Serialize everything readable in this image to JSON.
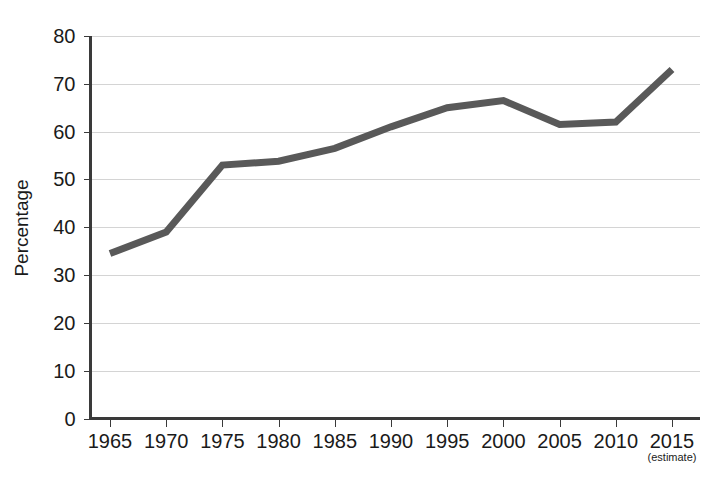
{
  "chart_data": {
    "type": "line",
    "title": "",
    "subtitle": "",
    "xlabel": "",
    "ylabel": "Percentage",
    "categories": [
      "1965",
      "1970",
      "1975",
      "1980",
      "1985",
      "1990",
      "1995",
      "2000",
      "2005",
      "2010",
      "2015"
    ],
    "x": [
      1965,
      1970,
      1975,
      1980,
      1985,
      1990,
      1995,
      2000,
      2005,
      2010,
      2015
    ],
    "values": [
      34.5,
      39.0,
      53.0,
      53.8,
      56.5,
      61.0,
      65.0,
      66.5,
      61.5,
      62.0,
      73.0
    ],
    "series": [
      {
        "name": "Percentage",
        "values": [
          34.5,
          39.0,
          53.0,
          53.8,
          56.5,
          61.0,
          65.0,
          66.5,
          61.5,
          62.0,
          73.0
        ],
        "color": "#595959"
      }
    ],
    "ylim": [
      0,
      80
    ],
    "yticks": [
      0,
      10,
      20,
      30,
      40,
      50,
      60,
      70,
      80
    ],
    "ytick_labels": [
      "0",
      "10",
      "20",
      "30",
      "40",
      "50",
      "60",
      "70",
      "80"
    ],
    "xlim": [
      1965,
      2015
    ],
    "grid": true,
    "grid_axis": "y",
    "legend": false,
    "legend_position": "none",
    "annotations": [
      {
        "text": "(estimate)",
        "attached_to_xtick": "2015",
        "position": "below-last-xtick"
      }
    ],
    "colors": {
      "line": "#595959",
      "gridline": "#d4d4d4",
      "axis": "#3a3a3a",
      "text": "#1a1a1a",
      "background": "#ffffff"
    }
  }
}
